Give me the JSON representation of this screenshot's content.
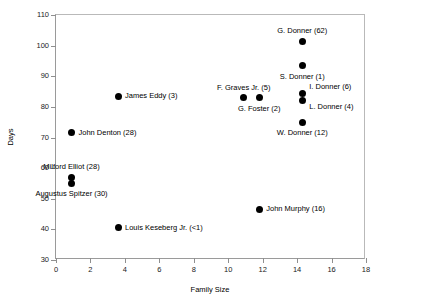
{
  "chart_data": {
    "type": "scatter",
    "title": "",
    "xlabel": "Family Size",
    "ylabel": "Days",
    "xlim": [
      0,
      18
    ],
    "ylim": [
      30,
      110
    ],
    "xticks": [
      0,
      2,
      4,
      6,
      8,
      10,
      12,
      14,
      16,
      18
    ],
    "yticks": [
      30,
      40,
      50,
      60,
      70,
      80,
      90,
      100,
      110
    ],
    "grid": false,
    "legend": "none",
    "points": [
      {
        "label": "G. Donner (62)",
        "x": 14.3,
        "y": 101.5,
        "anchor": "above"
      },
      {
        "label": "S. Donner (1)",
        "x": 14.3,
        "y": 93.5,
        "anchor": "below"
      },
      {
        "label": "I. Donner (6)",
        "x": 14.3,
        "y": 84.5,
        "anchor": "right-up"
      },
      {
        "label": "L. Donner (4)",
        "x": 14.3,
        "y": 82.0,
        "anchor": "right-down"
      },
      {
        "label": "W. Donner (12)",
        "x": 14.3,
        "y": 75.0,
        "anchor": "below"
      },
      {
        "label": "F. Graves Jr. (5)",
        "x": 10.9,
        "y": 83.0,
        "anchor": "above"
      },
      {
        "label": "G. Foster (2)",
        "x": 11.8,
        "y": 83.0,
        "anchor": "below"
      },
      {
        "label": "James Eddy (3)",
        "x": 3.6,
        "y": 83.5,
        "anchor": "right"
      },
      {
        "label": "John Denton (28)",
        "x": 0.9,
        "y": 71.5,
        "anchor": "right"
      },
      {
        "label": "Milford Elliot (28)",
        "x": 0.9,
        "y": 57.0,
        "anchor": "above"
      },
      {
        "label": "Augustus Spitzer (30)",
        "x": 0.9,
        "y": 55.0,
        "anchor": "below"
      },
      {
        "label": "Louis Keseberg Jr. (<1)",
        "x": 3.6,
        "y": 40.5,
        "anchor": "right"
      },
      {
        "label": "John Murphy (16)",
        "x": 11.8,
        "y": 46.5,
        "anchor": "right"
      }
    ]
  }
}
